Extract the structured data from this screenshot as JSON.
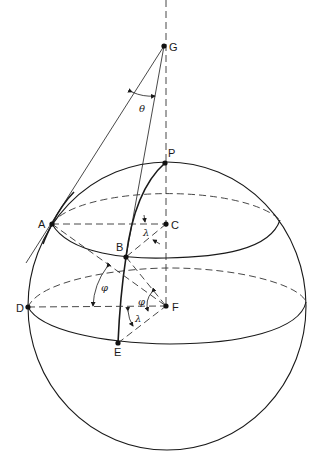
{
  "diagram": {
    "points": {
      "G": "G",
      "P": "P",
      "A": "A",
      "B": "B",
      "C": "C",
      "D": "D",
      "E": "E",
      "F": "F"
    },
    "angles": {
      "theta": "θ",
      "phi_upper": "φ",
      "phi_lower": "φ",
      "lambda_upper": "λ",
      "lambda_lower": "λ"
    },
    "colors": {
      "stroke": "#1a1a1a",
      "background": "#ffffff"
    }
  }
}
